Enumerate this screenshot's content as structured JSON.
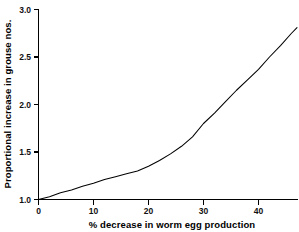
{
  "chart_data": {
    "type": "line",
    "title": "",
    "subtitle": "",
    "xlabel": "% decrease in worm egg production",
    "ylabel": "Proportional increase in grouse nos.",
    "xlim": [
      0,
      47
    ],
    "ylim": [
      1.0,
      3.0
    ],
    "xticks": [
      0,
      10,
      20,
      30,
      40
    ],
    "xtick_labels": [
      "0",
      "10",
      "20",
      "30",
      "40"
    ],
    "yticks": [
      1.0,
      1.5,
      2.0,
      2.5,
      3.0
    ],
    "ytick_labels": [
      "1.0",
      "1.5",
      "2.0",
      "2.5",
      "3.0"
    ],
    "grid": false,
    "legend": "none",
    "annotations": [],
    "series": [
      {
        "name": "Proportional increase in grouse numbers",
        "color": "#000000",
        "x": [
          0,
          2,
          4,
          6,
          8,
          10,
          12,
          14,
          16,
          18,
          20,
          22,
          24,
          26,
          28,
          30,
          32,
          34,
          36,
          38,
          40,
          42,
          44,
          46,
          47
        ],
        "values": [
          1.0,
          1.03,
          1.07,
          1.1,
          1.14,
          1.17,
          1.21,
          1.24,
          1.27,
          1.3,
          1.35,
          1.41,
          1.48,
          1.56,
          1.66,
          1.8,
          1.91,
          2.03,
          2.15,
          2.26,
          2.37,
          2.5,
          2.62,
          2.75,
          2.81
        ]
      }
    ]
  },
  "axis": {
    "x_tick_label_0": "0",
    "x_tick_label_1": "10",
    "x_tick_label_2": "20",
    "x_tick_label_3": "30",
    "x_tick_label_4": "40",
    "y_tick_label_0": "1.0",
    "y_tick_label_1": "1.5",
    "y_tick_label_2": "2.0",
    "y_tick_label_3": "2.5",
    "y_tick_label_4": "3.0",
    "x_title": "% decrease in worm egg production",
    "y_title": "Proportional increase in grouse nos."
  },
  "colors": {
    "background": "#ffffff",
    "ink": "#000000",
    "curve": "#000000"
  }
}
